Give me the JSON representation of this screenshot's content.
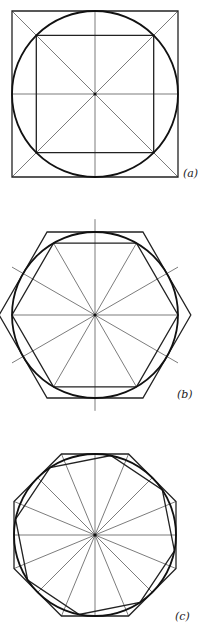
{
  "figures": [
    {
      "id": "a",
      "label": "(a)",
      "description": "Circle inscribed in a square with inscribed square, diagonals and center lines",
      "center": [
        95,
        94
      ],
      "radius": 83,
      "outer_polygon_sides": 4,
      "inner_polygon_sides": 4,
      "radial_lines": 8
    },
    {
      "id": "b",
      "label": "(b)",
      "description": "Circle with circumscribed hexagon and inscribed hexagon, 12 radial lines",
      "center": [
        95,
        315
      ],
      "radius": 83,
      "outer_polygon_sides": 6,
      "inner_polygon_sides": 6,
      "radial_lines": 12
    },
    {
      "id": "c",
      "label": "(c)",
      "description": "Circle with circumscribed octagon and inscribed octagon, 16 radial lines",
      "center": [
        95,
        535
      ],
      "radius": 81,
      "outer_polygon_sides": 8,
      "inner_polygon_sides": 8,
      "radial_lines": 16
    }
  ],
  "colors": {
    "line": "#222222",
    "background": "#ffffff"
  }
}
